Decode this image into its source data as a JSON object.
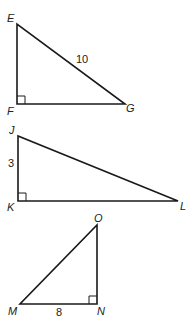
{
  "diagram": {
    "type": "right-triangles",
    "triangles": [
      {
        "name": "EFG",
        "vertices": {
          "E": {
            "label": "E",
            "x": 17,
            "y": 24
          },
          "F": {
            "label": "F",
            "x": 17,
            "y": 104
          },
          "G": {
            "label": "G",
            "x": 125,
            "y": 104
          }
        },
        "right_angle_at": "F",
        "side_labels": [
          {
            "side": "EG",
            "text": "10",
            "x": 113,
            "y": 63
          }
        ]
      },
      {
        "name": "JKL",
        "vertices": {
          "J": {
            "label": "J",
            "x": 18,
            "y": 136
          },
          "K": {
            "label": "K",
            "x": 18,
            "y": 201
          },
          "L": {
            "label": "L",
            "x": 178,
            "y": 201
          }
        },
        "right_angle_at": "K",
        "side_labels": [
          {
            "side": "JK",
            "text": "3",
            "x": 8,
            "y": 168
          }
        ]
      },
      {
        "name": "MNO",
        "vertices": {
          "M": {
            "label": "M",
            "x": 20,
            "y": 304
          },
          "N": {
            "label": "N",
            "x": 97,
            "y": 304
          },
          "O": {
            "label": "O",
            "x": 97,
            "y": 225
          }
        },
        "right_angle_at": "N",
        "side_labels": [
          {
            "side": "MN",
            "text": "8",
            "x": 56,
            "y": 316
          }
        ]
      }
    ]
  }
}
